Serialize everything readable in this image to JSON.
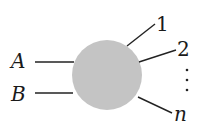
{
  "diagram": {
    "type": "scattering-blob",
    "blob": {
      "cx": 107,
      "cy": 75,
      "r": 35,
      "fill": "#c4c4c4"
    },
    "line_color": "#222222",
    "incoming": [
      {
        "label": "A",
        "x1": 35,
        "y1": 62,
        "x2": 74,
        "y2": 62,
        "tx": 20,
        "ty": 68
      },
      {
        "label": "B",
        "x1": 35,
        "y1": 93,
        "x2": 73,
        "y2": 93,
        "tx": 20,
        "ty": 100
      }
    ],
    "outgoing": [
      {
        "label": "1",
        "x1": 127,
        "y1": 46,
        "x2": 155,
        "y2": 24,
        "tx": 160,
        "ty": 30
      },
      {
        "label": "2",
        "x1": 139,
        "y1": 62,
        "x2": 176,
        "y2": 50,
        "tx": 180,
        "ty": 56
      },
      {
        "label": "n",
        "x1": 138,
        "y1": 97,
        "x2": 172,
        "y2": 113,
        "tx": 176,
        "ty": 119
      }
    ],
    "ellipsis": {
      "label": "⋮",
      "x": 187,
      "dots_y": [
        70,
        80,
        90
      ]
    }
  }
}
